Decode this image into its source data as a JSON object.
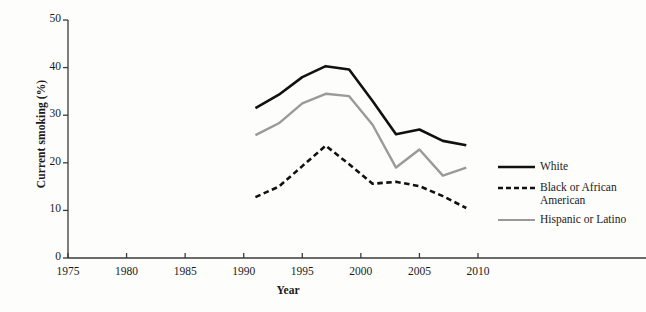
{
  "chart_data": {
    "type": "line",
    "title": "",
    "xlabel": "Year",
    "ylabel": "Current smoking (%)",
    "xlim": [
      1975,
      2010
    ],
    "ylim": [
      0,
      50
    ],
    "xticks": [
      1975,
      1980,
      1985,
      1990,
      1995,
      2000,
      2005,
      2010
    ],
    "yticks": [
      0,
      10,
      20,
      30,
      40,
      50
    ],
    "grid": false,
    "legend_position": "right",
    "series": [
      {
        "name": "White",
        "style": "solid",
        "color": "#111111",
        "width": 2.6,
        "x": [
          1991,
          1993,
          1995,
          1997,
          1999,
          2001,
          2003,
          2005,
          2007,
          2009
        ],
        "values": [
          31.5,
          34.3,
          38.0,
          40.3,
          39.6,
          33.0,
          26.0,
          27.0,
          24.6,
          23.7
        ]
      },
      {
        "name": "Black or African\nAmerican",
        "style": "dashed",
        "color": "#111111",
        "width": 2.6,
        "x": [
          1991,
          1993,
          1995,
          1997,
          1999,
          2001,
          2003,
          2005,
          2007,
          2009
        ],
        "values": [
          12.8,
          15.0,
          19.3,
          23.6,
          19.7,
          15.6,
          16.0,
          15.1,
          13.0,
          10.5
        ]
      },
      {
        "name": "Hispanic or Latino",
        "style": "solid",
        "color": "#9a9a9a",
        "width": 2.4,
        "x": [
          1991,
          1993,
          1995,
          1997,
          1999,
          2001,
          2003,
          2005,
          2007,
          2009
        ],
        "values": [
          25.8,
          28.3,
          32.5,
          34.5,
          34.0,
          28.0,
          19.0,
          22.8,
          17.3,
          19.0
        ]
      }
    ]
  },
  "legend": {
    "items": [
      {
        "label": "White",
        "style": "solid",
        "color": "#111111"
      },
      {
        "label": "Black or African\nAmerican",
        "style": "dashed",
        "color": "#111111"
      },
      {
        "label": "Hispanic or Latino",
        "style": "solid",
        "color": "#9a9a9a"
      }
    ]
  },
  "axes": {
    "x_title": "Year",
    "y_title": "Current smoking (%)",
    "x_tick_labels": [
      "1975",
      "1980",
      "1985",
      "1990",
      "1995",
      "2000",
      "2005",
      "2010"
    ],
    "y_tick_labels": [
      "0",
      "10",
      "20",
      "30",
      "40",
      "50"
    ],
    "axis_color": "#3a3a3a"
  }
}
